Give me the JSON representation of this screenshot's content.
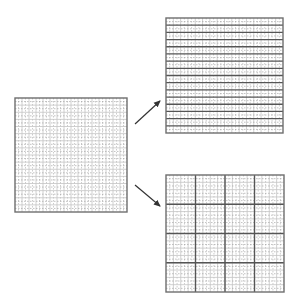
{
  "diagram": {
    "type": "grid-partitioning",
    "grid_cells": 16,
    "colors": {
      "background": "#ffffff",
      "border": "#6e6e6e",
      "minor_line": "#c4c4c4",
      "dashed_line": "#9a9a9a",
      "major_line": "#555555",
      "arrow": "#333333"
    },
    "panels": [
      {
        "id": "source-grid",
        "label": "",
        "x": 15,
        "y": 98,
        "width": 112,
        "height": 114,
        "partition": "none"
      },
      {
        "id": "row-partitioned-grid",
        "label": "",
        "x": 166,
        "y": 18,
        "width": 117,
        "height": 115,
        "partition": "rows",
        "major_every": 1
      },
      {
        "id": "block-partitioned-grid",
        "label": "",
        "x": 166,
        "y": 175,
        "width": 118,
        "height": 117,
        "partition": "blocks",
        "major_every": 4
      }
    ],
    "arrows": [
      {
        "id": "arrow-to-rows",
        "from": [
          135,
          124
        ],
        "to": [
          160,
          101
        ]
      },
      {
        "id": "arrow-to-blocks",
        "from": [
          135,
          185
        ],
        "to": [
          160,
          206
        ]
      }
    ]
  }
}
